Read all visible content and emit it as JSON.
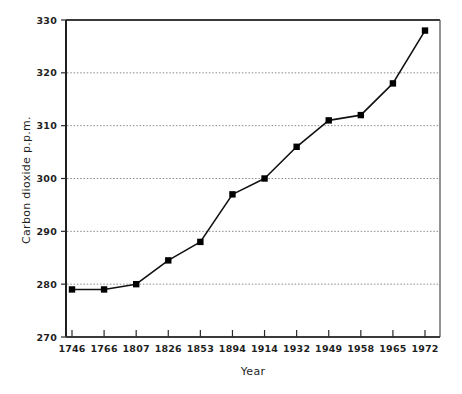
{
  "chart_data": {
    "type": "line",
    "title": "",
    "xlabel": "Year",
    "ylabel": "Carbon dioxide  p.p.m.",
    "categories": [
      "1746",
      "1766",
      "1807",
      "1826",
      "1853",
      "1894",
      "1914",
      "1932",
      "1949",
      "1958",
      "1965",
      "1972"
    ],
    "values": [
      279,
      279,
      280,
      284.5,
      288,
      297,
      300,
      306,
      311,
      312,
      318,
      328
    ],
    "ylim": [
      270,
      330
    ],
    "yticks": [
      "270",
      "280",
      "290",
      "300",
      "310",
      "320",
      "330"
    ],
    "ytick_values": [
      270,
      280,
      290,
      300,
      310,
      320,
      330
    ],
    "grid": "horizontal-dotted",
    "gridlines_at": [
      280,
      290,
      300,
      310,
      320
    ],
    "legend": "none",
    "marker": "filled-square",
    "line_color": "#111111",
    "marker_color": "#000000",
    "grid_color": "#8a8a8a",
    "axis_color": "#2b2b2b",
    "background": "#ffffff"
  },
  "axes": {
    "y_title": "Carbon dioxide  p.p.m.",
    "x_title": "Year"
  }
}
